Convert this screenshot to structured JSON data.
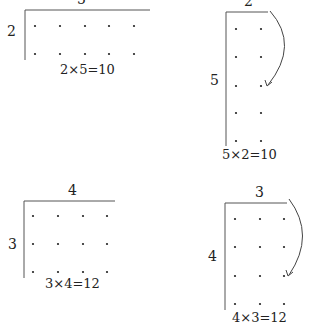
{
  "diagrams": [
    {
      "id": "top-left",
      "rows": 2,
      "cols": 5,
      "top_label": "5",
      "side_label": "2",
      "equation": "2×5=10",
      "rotation_arrow": false
    },
    {
      "id": "top-right",
      "rows": 5,
      "cols": 2,
      "top_label": "2",
      "side_label": "5",
      "equation": "5×2=10",
      "rotation_arrow": true
    },
    {
      "id": "bottom-left",
      "rows": 3,
      "cols": 4,
      "top_label": "4",
      "side_label": "3",
      "equation": "3×4=12",
      "rotation_arrow": false
    },
    {
      "id": "bottom-right",
      "rows": 4,
      "cols": 3,
      "top_label": "3",
      "side_label": "4",
      "equation": "4×3=12",
      "rotation_arrow": true
    }
  ],
  "colors": {
    "ink": "#222222",
    "axis": "#555555",
    "background": "#ffffff"
  }
}
